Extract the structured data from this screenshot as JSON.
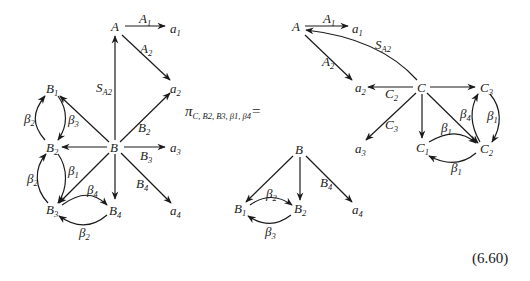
{
  "equation_number": "(6.60)",
  "projection_operator": {
    "symbol": "π",
    "subscript": "C, B2, B3, β1, β4",
    "equals": "="
  },
  "left_diagram": {
    "nodes": [
      {
        "id": "A",
        "base": "A",
        "sub": ""
      },
      {
        "id": "a1",
        "base": "a",
        "sub": "1"
      },
      {
        "id": "a2",
        "base": "a",
        "sub": "2"
      },
      {
        "id": "a3",
        "base": "a",
        "sub": "3"
      },
      {
        "id": "a4",
        "base": "a",
        "sub": "4"
      },
      {
        "id": "B",
        "base": "B",
        "sub": ""
      },
      {
        "id": "B1",
        "base": "B",
        "sub": "1"
      },
      {
        "id": "B2",
        "base": "B",
        "sub": "2"
      },
      {
        "id": "B3",
        "base": "B",
        "sub": "3"
      },
      {
        "id": "B4",
        "base": "B",
        "sub": "4"
      }
    ],
    "edges": [
      {
        "from": "A",
        "to": "a1",
        "label_base": "A",
        "label_sub": "1"
      },
      {
        "from": "A",
        "to": "a2",
        "label_base": "A",
        "label_sub": "2"
      },
      {
        "from": "B",
        "to": "A",
        "label_base": "S",
        "label_sub": "A2"
      },
      {
        "from": "B",
        "to": "a2",
        "label_base": "B",
        "label_sub": "2"
      },
      {
        "from": "B",
        "to": "a3",
        "label_base": "B",
        "label_sub": "3"
      },
      {
        "from": "B",
        "to": "a4",
        "label_base": "B",
        "label_sub": "4"
      },
      {
        "from": "B",
        "to": "B1",
        "label_base": "",
        "label_sub": ""
      },
      {
        "from": "B",
        "to": "B2",
        "label_base": "",
        "label_sub": ""
      },
      {
        "from": "B",
        "to": "B3",
        "label_base": "",
        "label_sub": ""
      },
      {
        "from": "B",
        "to": "B4",
        "label_base": "",
        "label_sub": ""
      },
      {
        "from": "B2",
        "to": "B1",
        "label_base": "β",
        "label_sub": "2"
      },
      {
        "from": "B1",
        "to": "B2",
        "label_base": "β",
        "label_sub": "3"
      },
      {
        "from": "B3",
        "to": "B2",
        "label_base": "β",
        "label_sub": "2"
      },
      {
        "from": "B2",
        "to": "B3",
        "label_base": "β",
        "label_sub": "1"
      },
      {
        "from": "B3",
        "to": "B4",
        "label_base": "β",
        "label_sub": "4"
      },
      {
        "from": "B4",
        "to": "B3",
        "label_base": "β",
        "label_sub": "2"
      }
    ]
  },
  "right_diagram": {
    "nodes": [
      {
        "id": "A",
        "base": "A",
        "sub": ""
      },
      {
        "id": "a1",
        "base": "a",
        "sub": "1"
      },
      {
        "id": "a2",
        "base": "a",
        "sub": "2"
      },
      {
        "id": "a3",
        "base": "a",
        "sub": "3"
      },
      {
        "id": "a4",
        "base": "a",
        "sub": "4"
      },
      {
        "id": "C",
        "base": "C",
        "sub": ""
      },
      {
        "id": "C1",
        "base": "C",
        "sub": "1"
      },
      {
        "id": "C2",
        "base": "C",
        "sub": "2"
      },
      {
        "id": "C3",
        "base": "C",
        "sub": "3"
      },
      {
        "id": "B",
        "base": "B",
        "sub": ""
      },
      {
        "id": "B1",
        "base": "B",
        "sub": "1"
      },
      {
        "id": "B2",
        "base": "B",
        "sub": "2"
      }
    ],
    "edges": [
      {
        "from": "A",
        "to": "a1",
        "label_base": "A",
        "label_sub": "1"
      },
      {
        "from": "A",
        "to": "a2",
        "label_base": "A",
        "label_sub": "2"
      },
      {
        "from": "C",
        "to": "A",
        "label_base": "S",
        "label_sub": "A2"
      },
      {
        "from": "C",
        "to": "a2",
        "label_base": "C",
        "label_sub": "2"
      },
      {
        "from": "C",
        "to": "a3",
        "label_base": "C",
        "label_sub": "3"
      },
      {
        "from": "C",
        "to": "C3",
        "label_base": "",
        "label_sub": ""
      },
      {
        "from": "C",
        "to": "C1",
        "label_base": "",
        "label_sub": ""
      },
      {
        "from": "C",
        "to": "C2",
        "label_base": "",
        "label_sub": ""
      },
      {
        "from": "C2",
        "to": "C3",
        "label_base": "β",
        "label_sub": "4"
      },
      {
        "from": "C3",
        "to": "C2",
        "label_base": "β",
        "label_sub": "1"
      },
      {
        "from": "C1",
        "to": "C2",
        "label_base": "β",
        "label_sub": "1"
      },
      {
        "from": "C2",
        "to": "C1",
        "label_base": "β",
        "label_sub": "1"
      },
      {
        "from": "B",
        "to": "B1",
        "label_base": "",
        "label_sub": ""
      },
      {
        "from": "B",
        "to": "B2",
        "label_base": "",
        "label_sub": ""
      },
      {
        "from": "B",
        "to": "a4",
        "label_base": "B",
        "label_sub": "4"
      },
      {
        "from": "B1",
        "to": "B2",
        "label_base": "β",
        "label_sub": "2"
      },
      {
        "from": "B2",
        "to": "B1",
        "label_base": "β",
        "label_sub": "3"
      }
    ]
  }
}
